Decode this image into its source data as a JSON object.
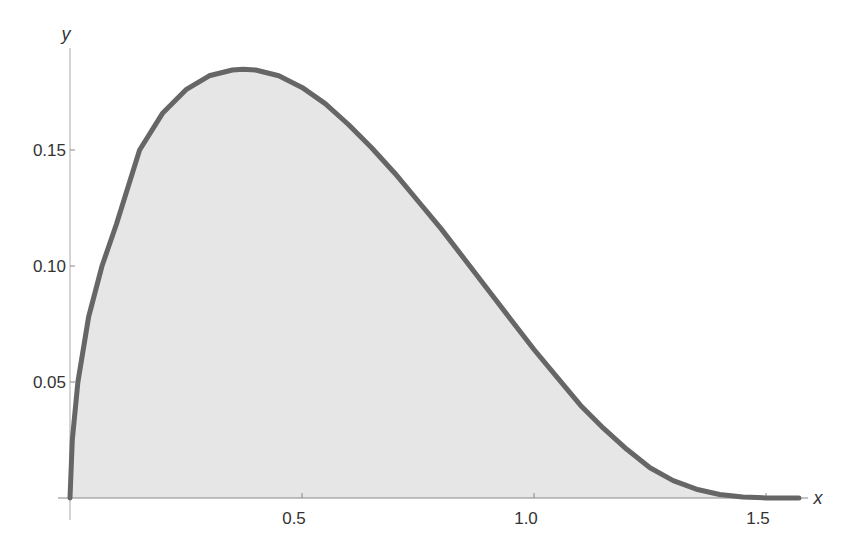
{
  "chart_data": {
    "type": "area",
    "title": "",
    "xlabel": "x",
    "ylabel": "y",
    "xlim": [
      0,
      1.5708
    ],
    "ylim": [
      0,
      0.185
    ],
    "grid": false,
    "legend": null,
    "x_ticks": [
      0.5,
      1.0,
      1.5
    ],
    "x_tick_labels": [
      "0.5",
      "1.0",
      "1.5"
    ],
    "y_ticks": [
      0.05,
      0.1,
      0.15
    ],
    "y_tick_labels": [
      "0.05",
      "0.10",
      "0.15"
    ],
    "series": [
      {
        "name": "f(x)",
        "fill": true,
        "x": [
          0,
          0.005,
          0.017,
          0.04,
          0.069,
          0.1,
          0.15,
          0.2,
          0.25,
          0.3,
          0.35,
          0.373,
          0.4,
          0.45,
          0.5,
          0.55,
          0.6,
          0.65,
          0.7,
          0.75,
          0.8,
          0.85,
          0.9,
          0.95,
          1.0,
          1.05,
          1.1,
          1.15,
          1.2,
          1.25,
          1.3,
          1.35,
          1.4,
          1.45,
          1.5,
          1.54,
          1.5708
        ],
        "y": [
          0,
          0.025,
          0.05,
          0.078,
          0.1,
          0.118,
          0.15,
          0.166,
          0.176,
          0.182,
          0.1845,
          0.1848,
          0.1845,
          0.182,
          0.177,
          0.17,
          0.161,
          0.151,
          0.14,
          0.128,
          0.116,
          0.103,
          0.09,
          0.077,
          0.064,
          0.052,
          0.04,
          0.03,
          0.021,
          0.013,
          0.0075,
          0.0038,
          0.0015,
          0.0004,
          5e-05,
          0,
          0
        ]
      }
    ],
    "colors": {
      "line": "#666666",
      "fill": "#e6e6e6",
      "axis": "#888888"
    }
  }
}
